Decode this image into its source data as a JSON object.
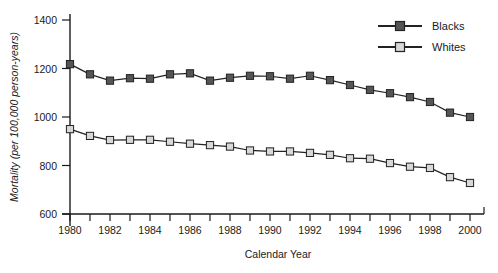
{
  "chart_data": {
    "type": "line",
    "title": "",
    "xlabel": "Calendar Year",
    "ylabel": "Mortality (per 100,000 person-years)",
    "xlim": [
      1980,
      2000
    ],
    "ylim": [
      600,
      1400
    ],
    "xticks": [
      1980,
      1981,
      1982,
      1983,
      1984,
      1985,
      1986,
      1987,
      1988,
      1989,
      1990,
      1991,
      1992,
      1993,
      1994,
      1995,
      1996,
      1997,
      1998,
      1999,
      2000
    ],
    "xticklabels": [
      "1980",
      "",
      "1982",
      "",
      "1984",
      "",
      "1986",
      "",
      "1988",
      "",
      "1990",
      "",
      "1992",
      "",
      "1994",
      "",
      "1996",
      "",
      "1998",
      "",
      "2000"
    ],
    "yticks": [
      600,
      800,
      1000,
      1200,
      1400
    ],
    "yticklabels": [
      "600",
      "800",
      "1000",
      "1200",
      "1400"
    ],
    "grid": false,
    "legend_position": "top-right",
    "x": [
      1980,
      1981,
      1982,
      1983,
      1984,
      1985,
      1986,
      1987,
      1988,
      1989,
      1990,
      1991,
      1992,
      1993,
      1994,
      1995,
      1996,
      1997,
      1998,
      1999,
      2000
    ],
    "series": [
      {
        "name": "Blacks",
        "marker": "filled-square",
        "color": "#555555",
        "values": [
          1218,
          1176,
          1150,
          1160,
          1158,
          1176,
          1180,
          1150,
          1162,
          1170,
          1168,
          1158,
          1170,
          1152,
          1132,
          1112,
          1098,
          1082,
          1062,
          1018,
          1000
        ]
      },
      {
        "name": "Whites",
        "marker": "open-square",
        "color": "#d8d8d8",
        "values": [
          950,
          922,
          905,
          906,
          906,
          898,
          890,
          884,
          878,
          862,
          858,
          858,
          852,
          844,
          830,
          828,
          810,
          795,
          790,
          752,
          728
        ]
      }
    ]
  },
  "legend": {
    "entries": [
      {
        "label": "Blacks"
      },
      {
        "label": "Whites"
      }
    ]
  },
  "colors": {
    "blacks_marker_fill": "#555555",
    "whites_marker_fill": "#d8d8d8",
    "marker_stroke": "#222222",
    "axis": "#1a1a1a",
    "background": "#ffffff"
  }
}
